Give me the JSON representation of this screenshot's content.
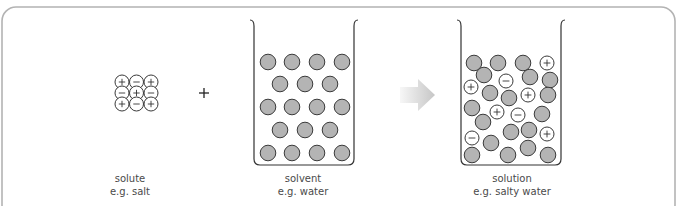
{
  "figure": {
    "frame_color": "#b3b3b3",
    "particle_fill": "#b4b4b4",
    "particle_stroke": "#3a3a3a",
    "ion_fill": "#ffffff",
    "arrow_gradient": [
      "#f7f7f7",
      "#c6c6c6"
    ]
  },
  "panels": {
    "solute": {
      "label": "solute",
      "example": "e.g. salt",
      "lattice": [
        [
          "+",
          "−",
          "+"
        ],
        [
          "−",
          "+",
          "−"
        ],
        [
          "+",
          "−",
          "+"
        ]
      ]
    },
    "operator": "+",
    "solvent": {
      "label": "solvent",
      "example": "e.g. water",
      "rows": [
        4,
        3,
        4,
        3,
        4
      ]
    },
    "arrow": "right-arrow",
    "solution": {
      "label": "solution",
      "example": "e.g. salty water",
      "particles": [
        {
          "x": 474,
          "y": 63,
          "type": "water"
        },
        {
          "x": 498,
          "y": 63,
          "type": "water"
        },
        {
          "x": 523,
          "y": 63,
          "type": "water"
        },
        {
          "x": 547,
          "y": 63,
          "type": "ion",
          "charge": "+"
        },
        {
          "x": 484,
          "y": 75,
          "type": "water"
        },
        {
          "x": 506,
          "y": 81,
          "type": "ion",
          "charge": "−"
        },
        {
          "x": 530,
          "y": 77,
          "type": "water"
        },
        {
          "x": 550,
          "y": 80,
          "type": "water"
        },
        {
          "x": 471,
          "y": 87,
          "type": "ion",
          "charge": "+"
        },
        {
          "x": 490,
          "y": 93,
          "type": "water"
        },
        {
          "x": 509,
          "y": 98,
          "type": "water"
        },
        {
          "x": 528,
          "y": 95,
          "type": "ion",
          "charge": "+"
        },
        {
          "x": 548,
          "y": 95,
          "type": "water"
        },
        {
          "x": 472,
          "y": 108,
          "type": "water"
        },
        {
          "x": 497,
          "y": 112,
          "type": "ion",
          "charge": "+"
        },
        {
          "x": 518,
          "y": 115,
          "type": "ion",
          "charge": "−"
        },
        {
          "x": 542,
          "y": 114,
          "type": "water"
        },
        {
          "x": 483,
          "y": 122,
          "type": "water"
        },
        {
          "x": 511,
          "y": 132,
          "type": "water"
        },
        {
          "x": 529,
          "y": 130,
          "type": "water"
        },
        {
          "x": 547,
          "y": 134,
          "type": "ion",
          "charge": "+"
        },
        {
          "x": 472,
          "y": 138,
          "type": "ion",
          "charge": "−"
        },
        {
          "x": 491,
          "y": 143,
          "type": "water"
        },
        {
          "x": 472,
          "y": 155,
          "type": "water"
        },
        {
          "x": 508,
          "y": 155,
          "type": "water"
        },
        {
          "x": 528,
          "y": 148,
          "type": "water"
        },
        {
          "x": 548,
          "y": 155,
          "type": "water"
        }
      ]
    }
  }
}
